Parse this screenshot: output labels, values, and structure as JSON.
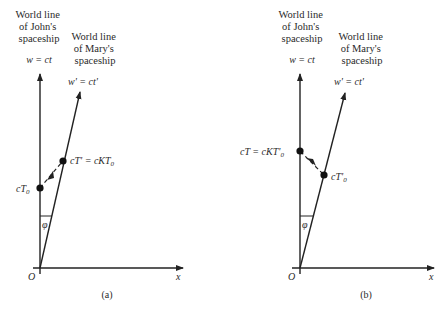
{
  "panel_a": {
    "john_title": [
      "World line",
      "of John's",
      "spaceship"
    ],
    "john_eq": "w = ct",
    "mary_title": [
      "World line",
      "of Mary's",
      "spaceship"
    ],
    "mary_eq": "w' = ct'",
    "point_lower": "cT",
    "point_lower_sub": "0",
    "point_upper": "cT' = cKT",
    "point_upper_sub": "0",
    "angle": "φ",
    "origin": "O",
    "x_axis": "x",
    "caption": "(a)"
  },
  "panel_b": {
    "john_title": [
      "World line",
      "of John's",
      "spaceship"
    ],
    "john_eq": "w = ct",
    "mary_title": [
      "World line",
      "of Mary's",
      "spaceship"
    ],
    "mary_eq": "w' = ct'",
    "point_upper": "cT = cKT'",
    "point_upper_sub": "0",
    "point_lower": "cT'",
    "point_lower_sub": "0",
    "angle": "φ",
    "origin": "O",
    "x_axis": "x",
    "caption": "(b)"
  }
}
